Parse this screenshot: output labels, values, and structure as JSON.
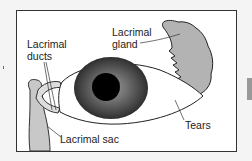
{
  "diagram": {
    "labels": {
      "gland_line1": "Lacrimal",
      "gland_line2": "gland",
      "ducts_line1": "Lacrimal",
      "ducts_line2": "ducts",
      "sac": "Lacrimal sac",
      "tears": "Tears"
    },
    "colors": {
      "frame": "#333333",
      "background": "#ffffff",
      "gland_fill": "#b3b3b3",
      "sac_fill": "#c8c8c8",
      "iris": "#555555",
      "pupil": "#000000"
    }
  }
}
